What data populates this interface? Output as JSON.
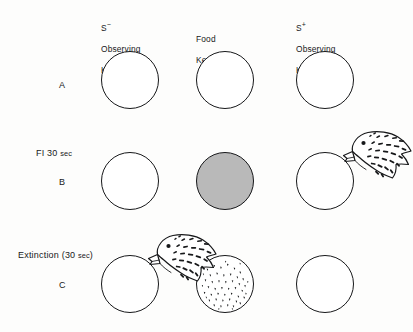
{
  "figure": {
    "background_color": "#fdfdfc",
    "ink_color": "#17181a",
    "gray_fill_color": "#b9b9b9"
  },
  "columns": [
    {
      "id": "s-minus-observing-key",
      "label": "S−\nObserving\nKey",
      "symbol": "S",
      "superscript": "−",
      "lines": [
        "Observing",
        "Key"
      ]
    },
    {
      "id": "food-key",
      "label": "Food\nKey",
      "symbol": "",
      "superscript": "",
      "lines": [
        "Food",
        "Key"
      ]
    },
    {
      "id": "s-plus-observing-key",
      "label": "S+\nObserving\nKey",
      "symbol": "S",
      "superscript": "+",
      "lines": [
        "Observing",
        "Key"
      ]
    }
  ],
  "rows": [
    {
      "letter": "A",
      "condition": "",
      "condition_small": "",
      "keys": [
        {
          "column": "s-minus-observing-key",
          "state": "blank",
          "bird": false
        },
        {
          "column": "food-key",
          "state": "blank",
          "bird": false
        },
        {
          "column": "s-plus-observing-key",
          "state": "blank",
          "bird": false
        }
      ]
    },
    {
      "letter": "B",
      "condition": "FI 30 ",
      "condition_small": "sec",
      "keys": [
        {
          "column": "s-minus-observing-key",
          "state": "blank",
          "bird": false
        },
        {
          "column": "food-key",
          "state": "gray-halftone",
          "bird": false
        },
        {
          "column": "s-plus-observing-key",
          "state": "blank",
          "bird": true
        }
      ]
    },
    {
      "letter": "C",
      "condition_prefix": "Extinction (30 ",
      "condition_small": "sec",
      "condition_suffix": ")",
      "keys": [
        {
          "column": "s-minus-observing-key",
          "state": "blank",
          "bird": true
        },
        {
          "column": "food-key",
          "state": "speckled",
          "bird": false
        },
        {
          "column": "s-plus-observing-key",
          "state": "blank",
          "bird": false
        }
      ]
    }
  ],
  "bird": {
    "name": "pigeon",
    "description": "pigeon head pecking key"
  }
}
